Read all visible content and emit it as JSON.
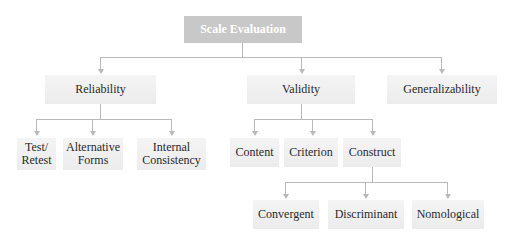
{
  "diagram": {
    "root": {
      "label": "Scale Evaluation"
    },
    "level1": [
      {
        "label": "Reliability"
      },
      {
        "label": "Validity"
      },
      {
        "label": "Generalizability"
      }
    ],
    "reliability_children": [
      {
        "label": "Test/\nRetest"
      },
      {
        "label": "Alternative\nForms"
      },
      {
        "label": "Internal\nConsistency"
      }
    ],
    "validity_children": [
      {
        "label": "Content"
      },
      {
        "label": "Criterion"
      },
      {
        "label": "Construct"
      }
    ],
    "construct_children": [
      {
        "label": "Convergent"
      },
      {
        "label": "Discriminant"
      },
      {
        "label": "Nomological"
      }
    ],
    "colors": {
      "root_fill": "#c8c8c8",
      "node_fill": "#efefef",
      "connector": "#b9b9b9",
      "text": "#2a2a2a"
    }
  }
}
